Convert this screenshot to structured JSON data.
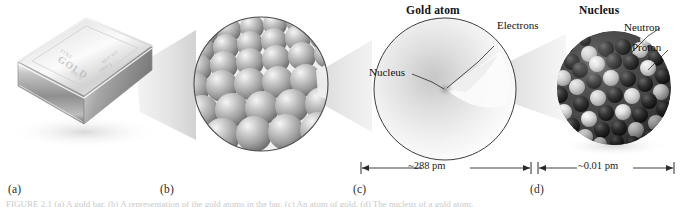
{
  "figure": {
    "caption": "FIGURE 2.1 (a) A gold bar. (b) A representation of the gold atoms in the bar. (c) An atom of gold. (d) The nucleus of a gold atom.",
    "panels": [
      {
        "letter": "(a)",
        "name": "gold-bar",
        "bar_stamp_main": "GOLD",
        "bar_stamp_top": "FINE",
        "bar_stamp_sub": "999.9",
        "bar_stamp_side_1": "NET WT.",
        "bar_stamp_side_2": "1000 g"
      },
      {
        "letter": "(b)",
        "name": "gold-atoms-cluster"
      },
      {
        "letter": "(c)",
        "name": "gold-atom",
        "heading": "Gold atom",
        "label_electrons": "Electrons",
        "label_nucleus": "Nucleus",
        "dimension": "~288 pm"
      },
      {
        "letter": "(d)",
        "name": "nucleus",
        "heading": "Nucleus",
        "label_neutron": "Neutron",
        "label_proton": "Proton",
        "dimension": "~0.01 pm"
      }
    ]
  },
  "colors": {
    "ink": "#111111",
    "rule": "#3a3a3a",
    "funnel": "#e2e2e2",
    "sphere_light": "#d8d8d8",
    "sphere_mid": "#9a9a9a",
    "sphere_dark": "#2e2e2e",
    "metal_light": "#f2f2f2",
    "metal_mid": "#b9b9b9",
    "metal_dark": "#6e6e6e"
  }
}
